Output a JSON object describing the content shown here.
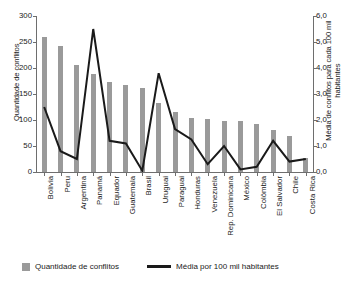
{
  "chart_data": {
    "type": "bar",
    "title": "",
    "xlabel": "",
    "ylabel": "Quantidade de conflitos",
    "y2label": "Média de conflitos para cada 100 mil habitantes",
    "ylim": [
      0,
      300
    ],
    "y2lim": [
      0,
      6
    ],
    "yticks": [
      "300",
      "250",
      "200",
      "150",
      "100",
      "50",
      "0"
    ],
    "ytick_values": [
      300,
      250,
      200,
      150,
      100,
      50,
      0
    ],
    "y2ticks": [
      "6,0",
      "5,0",
      "4,0",
      "3,0",
      "2,0",
      "1,0",
      "0,0"
    ],
    "y2tick_values": [
      6.0,
      5.0,
      4.0,
      3.0,
      2.0,
      1.0,
      0.0
    ],
    "grid": false,
    "legend_position": "bottom-left",
    "categories": [
      "Bolívia",
      "Peru",
      "Argentina",
      "Panamá",
      "Equador",
      "Guatemala",
      "Brasil",
      "Uruguai",
      "Paraguai",
      "Honduras",
      "Venezuela",
      "Rep. Dominicana",
      "México",
      "Colômbia",
      "El Salvador",
      "Chile",
      "Costa Rica"
    ],
    "series": [
      {
        "name": "Quantidade de conflitos",
        "type": "bar",
        "axis": "left",
        "color": "#9a9a9a",
        "values": [
          260,
          243,
          205,
          188,
          173,
          167,
          161,
          132,
          115,
          104,
          102,
          99,
          99,
          93,
          81,
          70,
          27
        ]
      },
      {
        "name": "Média por 100 mil habitantes",
        "type": "line",
        "axis": "right",
        "color": "#1a1a1a",
        "values": [
          2.5,
          0.8,
          0.5,
          5.5,
          1.2,
          1.1,
          0.05,
          3.8,
          1.65,
          1.25,
          0.3,
          1.0,
          0.1,
          0.2,
          1.2,
          0.4,
          0.5
        ]
      }
    ]
  },
  "legend": {
    "items": [
      {
        "label": "Quantidade de conflitos",
        "marker": "square-swatch"
      },
      {
        "label": "Média por 100 mil habitantes",
        "marker": "line-swatch"
      }
    ]
  }
}
